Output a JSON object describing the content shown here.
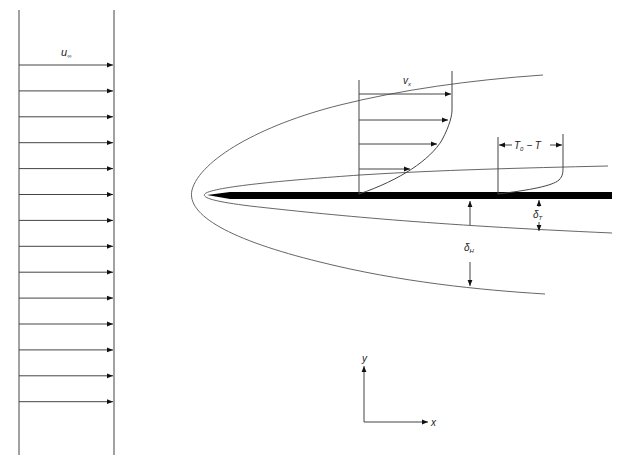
{
  "diagram": {
    "type": "boundary-layer-schematic",
    "title": "",
    "freestream": {
      "label_main": "u",
      "label_sub": "∞",
      "arrow_count": 14
    },
    "velocity_profile": {
      "label_main": "v",
      "label_sub": "x",
      "arrow_count": 4
    },
    "temperature_profile": {
      "label_main": "T",
      "label_sub": "0",
      "label_rest": " − T"
    },
    "hydrodynamic_layer": {
      "label_main": "δ",
      "label_sub": "H"
    },
    "thermal_layer": {
      "label_main": "δ",
      "label_sub": "T"
    },
    "axes": {
      "y_label": "y",
      "x_label": "x"
    },
    "colors": {
      "line": "#444444",
      "plate": "#000000",
      "background": "#ffffff"
    }
  }
}
